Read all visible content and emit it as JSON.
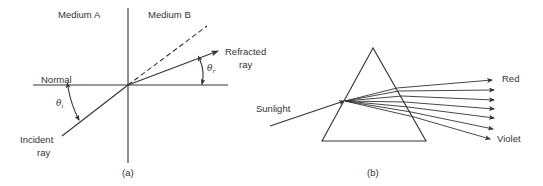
{
  "figure_a": {
    "caption": "(a)",
    "medium_a_label": "Medium A",
    "medium_b_label": "Medium B",
    "normal_label": "Normal",
    "incident_label_line1": "Incident",
    "incident_label_line2": "ray",
    "refracted_label_line1": "Refracted",
    "refracted_label_line2": "ray",
    "theta_i": "θ",
    "theta_i_sub": "i",
    "theta_r": "θ",
    "theta_r_sub": "r"
  },
  "figure_b": {
    "caption": "(b)",
    "sunlight_label": "Sunlight",
    "red_label": "Red",
    "violet_label": "Violet",
    "spectrum_ray_count": 7
  },
  "colors": {
    "ink": "#333333",
    "background": "#ffffff"
  }
}
